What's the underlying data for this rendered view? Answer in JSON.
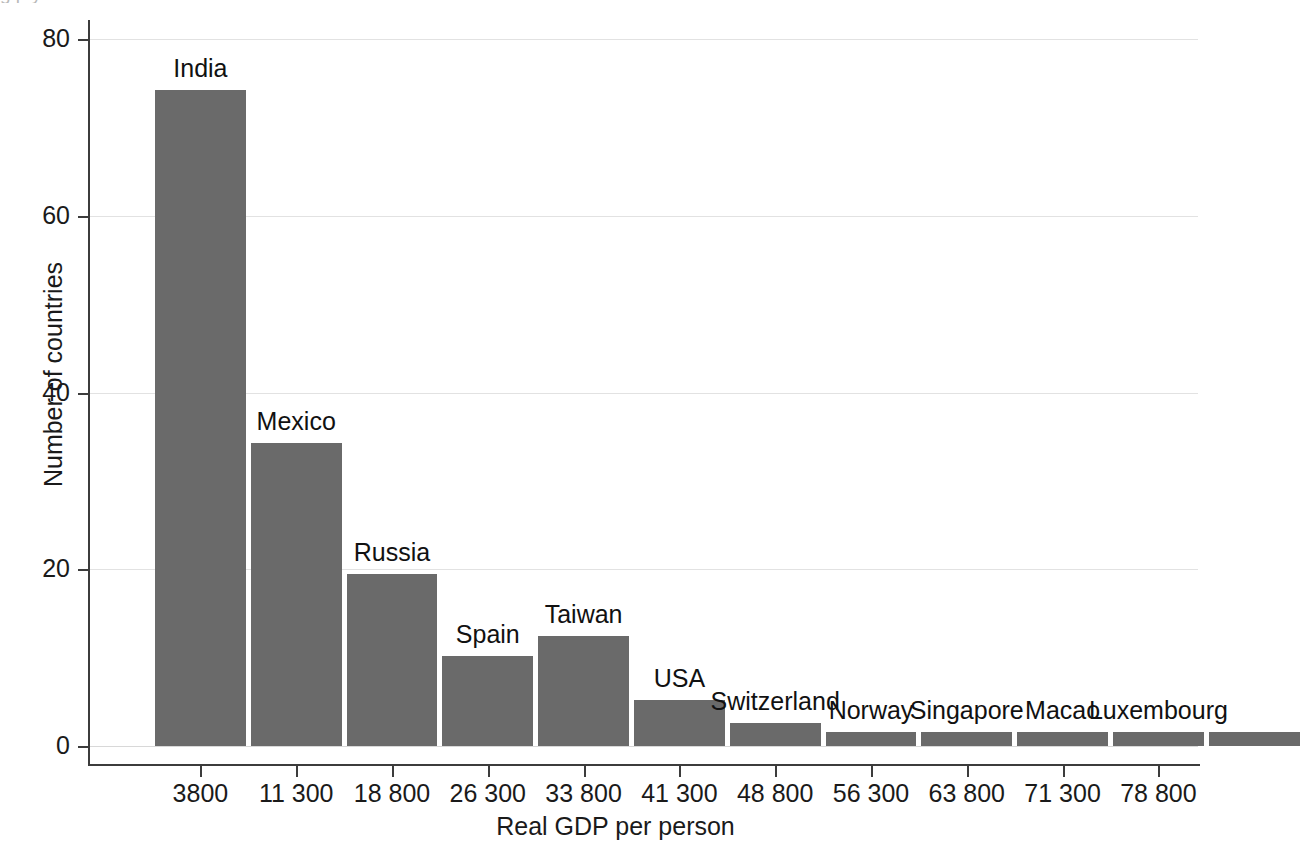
{
  "figure": {
    "cut_off_title": "g p y",
    "x_axis_title": "Real GDP per person",
    "y_axis_title": "Number of countries"
  },
  "chart_data": {
    "type": "bar",
    "title": "",
    "subtitle": "",
    "xlabel": "Real GDP per person",
    "ylabel": "Number of countries",
    "categories": [
      "3800",
      "11 300",
      "18 800",
      "26 300",
      "33 800",
      "41 300",
      "48 800",
      "56 300",
      "63 800",
      "71 300",
      "78 800",
      "86 300"
    ],
    "values": [
      74.2,
      34.3,
      19.5,
      10.2,
      12.4,
      5.2,
      2.6,
      1.6,
      1.6,
      1.6,
      1.6,
      1.6
    ],
    "bar_labels": [
      "India",
      "Mexico",
      "Russia",
      "Spain",
      "Taiwan",
      "USA",
      "Switzerland",
      "Norway",
      "Singapore",
      "Macao",
      "Luxembourg",
      ""
    ],
    "x_tick_labels": [
      "3800",
      "11 300",
      "18 800",
      "26 300",
      "33 800",
      "41 300",
      "48 800",
      "56 300",
      "63 800",
      "71 300",
      "78 800"
    ],
    "y_tick_labels": [
      "0",
      "20",
      "40",
      "60",
      "80"
    ],
    "y_ticks": [
      0,
      20,
      40,
      60,
      80
    ],
    "ylim": [
      0,
      80
    ],
    "grid": "horizontal",
    "legend": "none",
    "bar_color": "#6a6a6a",
    "grid_color": "#e2e2e2",
    "axis_color": "#3c3c3c"
  }
}
